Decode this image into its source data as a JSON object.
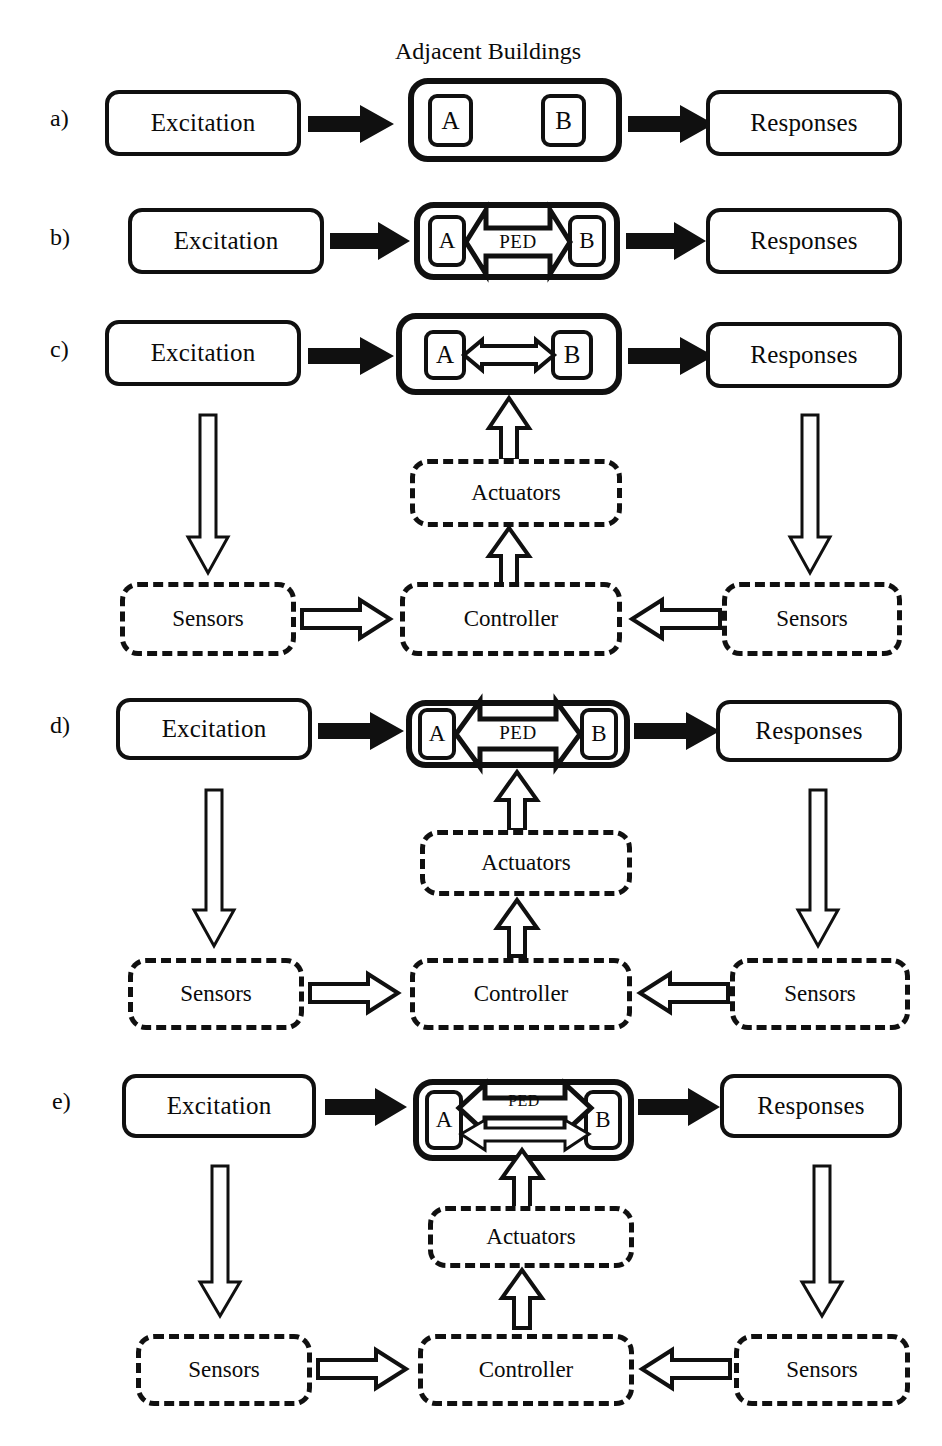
{
  "figure": {
    "title": "Adjacent Buildings",
    "type": "block-diagram"
  },
  "labels": {
    "a": "a)",
    "b": "b)",
    "c": "c)",
    "d": "d)",
    "e": "e)"
  },
  "blocks": {
    "excitation": "Excitation",
    "responses": "Responses",
    "building_a": "A",
    "building_b": "B",
    "ped": "PED",
    "sensors": "Sensors",
    "controller": "Controller",
    "actuators": "Actuators"
  },
  "rows": [
    {
      "id": "a",
      "label": "a)",
      "title": "Adjacent Buildings",
      "left": "Excitation",
      "right": "Responses",
      "buildings": [
        "A",
        "B"
      ],
      "coupling": "none",
      "has_control_loop": false
    },
    {
      "id": "b",
      "label": "b)",
      "left": "Excitation",
      "right": "Responses",
      "buildings": [
        "A",
        "B"
      ],
      "coupling": "PED",
      "coupling_label": "PED",
      "has_control_loop": false
    },
    {
      "id": "c",
      "label": "c)",
      "left": "Excitation",
      "right": "Responses",
      "buildings": [
        "A",
        "B"
      ],
      "coupling": "thin-link",
      "has_control_loop": true,
      "loop": [
        "Sensors",
        "Controller",
        "Actuators",
        "Sensors"
      ]
    },
    {
      "id": "d",
      "label": "d)",
      "left": "Excitation",
      "right": "Responses",
      "buildings": [
        "A",
        "B"
      ],
      "coupling": "PED",
      "coupling_label": "PED",
      "has_control_loop": true,
      "loop": [
        "Sensors",
        "Controller",
        "Actuators",
        "Sensors"
      ]
    },
    {
      "id": "e",
      "label": "e)",
      "left": "Excitation",
      "right": "Responses",
      "buildings": [
        "A",
        "B"
      ],
      "coupling": "PED-plus-actuator",
      "coupling_label": "PED",
      "has_control_loop": true,
      "loop": [
        "Sensors",
        "Controller",
        "Actuators",
        "Sensors"
      ]
    }
  ],
  "colors": {
    "ink": "#101010",
    "paper": "#ffffff"
  }
}
